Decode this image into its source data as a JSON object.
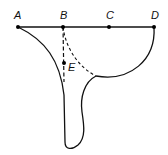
{
  "diagram": {
    "points": [
      {
        "id": "A",
        "label": "A",
        "x": 18,
        "y": 27,
        "label_x": 14,
        "label_y": 19
      },
      {
        "id": "B",
        "label": "B",
        "x": 63,
        "y": 27,
        "label_x": 60,
        "label_y": 19
      },
      {
        "id": "C",
        "label": "C",
        "x": 109,
        "y": 27,
        "label_x": 106,
        "label_y": 19
      },
      {
        "id": "D",
        "label": "D",
        "x": 154,
        "y": 27,
        "label_x": 151,
        "label_y": 19
      },
      {
        "id": "E",
        "label": "E",
        "x": 64,
        "y": 63,
        "label_x": 68,
        "label_y": 71
      }
    ],
    "line_color": "#111111"
  }
}
